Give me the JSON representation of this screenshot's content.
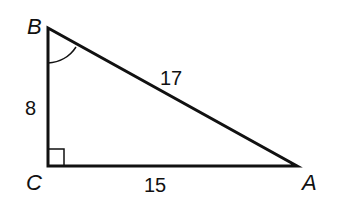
{
  "diagram": {
    "type": "right-triangle",
    "vertices": [
      {
        "name": "B",
        "x": 48,
        "y": 28
      },
      {
        "name": "C",
        "x": 48,
        "y": 166
      },
      {
        "name": "A",
        "x": 297,
        "y": 166
      }
    ],
    "vertex_labels": {
      "B": "B",
      "C": "C",
      "A": "A"
    },
    "side_labels": {
      "BC": "8",
      "CA": "15",
      "AB": "17"
    },
    "right_angle_at": "C",
    "marked_angle_at": "B",
    "colors": {
      "stroke": "#111111",
      "background": "#ffffff"
    }
  }
}
